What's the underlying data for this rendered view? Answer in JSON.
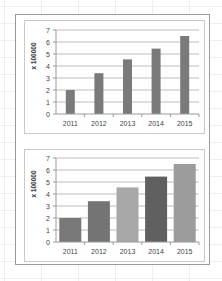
{
  "chart_data": [
    {
      "type": "bar",
      "title": "",
      "categories": [
        "2011",
        "2012",
        "2013",
        "2014",
        "2015"
      ],
      "values": [
        2.0,
        3.4,
        4.55,
        5.45,
        6.5
      ],
      "xlabel": "",
      "ylabel": "x 100000",
      "ylim": [
        0,
        7
      ],
      "yticks": [
        0,
        1,
        2,
        3,
        4,
        5,
        6,
        7
      ],
      "grid": true,
      "legend": "none",
      "bar_colors": [
        "#7a7a7a",
        "#7a7a7a",
        "#7a7a7a",
        "#7a7a7a",
        "#7a7a7a"
      ],
      "bar_width": "narrow"
    },
    {
      "type": "bar",
      "title": "",
      "categories": [
        "2011",
        "2012",
        "2013",
        "2014",
        "2015"
      ],
      "values": [
        2.0,
        3.4,
        4.55,
        5.45,
        6.5
      ],
      "xlabel": "",
      "ylabel": "x 100000",
      "ylim": [
        0,
        7
      ],
      "yticks": [
        0,
        1,
        2,
        3,
        4,
        5,
        6,
        7
      ],
      "grid": true,
      "legend": "none",
      "bar_colors": [
        "#787878",
        "#747474",
        "#a8a8a8",
        "#606060",
        "#9c9c9c"
      ],
      "bar_width": "wide"
    }
  ]
}
